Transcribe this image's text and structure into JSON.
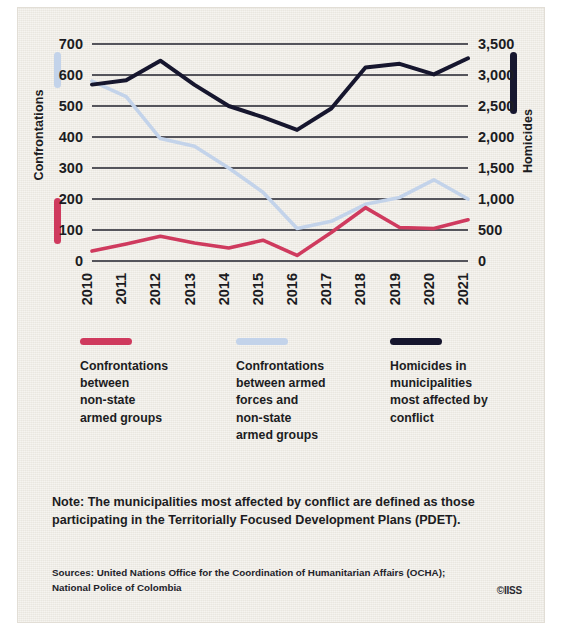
{
  "axes": {
    "left_title": "Confrontations",
    "right_title": "Homicides",
    "left_ticks": [
      "700",
      "600",
      "500",
      "400",
      "300",
      "200",
      "100",
      "0"
    ],
    "right_ticks": [
      "3,500",
      "3,000",
      "2,500",
      "2,000",
      "1,500",
      "1,000",
      "500",
      "0"
    ],
    "x_ticks": [
      "2010",
      "2011",
      "2012",
      "2013",
      "2014",
      "2015",
      "2016",
      "2017",
      "2018",
      "2019",
      "2020",
      "2021"
    ]
  },
  "legend": [
    {
      "key": "confrontations-non-state",
      "color": "#cf3a5e",
      "lines": [
        "Confrontations",
        "between",
        "non-state",
        "armed groups"
      ]
    },
    {
      "key": "confrontations-armed-forces",
      "color": "#c3d3ea",
      "lines": [
        "Confrontations",
        "between armed",
        "forces and",
        "non-state",
        "armed groups"
      ]
    },
    {
      "key": "homicides",
      "color": "#16162e",
      "lines": [
        "Homicides in",
        "municipalities",
        "most affected by",
        "conflict"
      ]
    }
  ],
  "note": "Note: The municipalities most affected by conflict are defined as those participating in the Territorially Focused Development Plans (PDET).",
  "sources": "Sources: United Nations Office for the Coordination of Humanitarian Affairs (OCHA); National Police of Colombia",
  "copyright": "©IISS",
  "colors": {
    "background": "#eeebe4",
    "gridline": "#55555c",
    "text": "#1c1c22",
    "crimson": "#cf3a5e",
    "lightblue": "#c3d3ea",
    "navy": "#16162e"
  },
  "chart_data": {
    "type": "line",
    "title": "",
    "xlabel": "",
    "ylabel": "Confrontations",
    "y2label": "Homicides",
    "x": [
      "2010",
      "2011",
      "2012",
      "2013",
      "2014",
      "2015",
      "2016",
      "2017",
      "2018",
      "2019",
      "2020",
      "2021"
    ],
    "ylim": [
      0,
      700
    ],
    "y2lim": [
      0,
      3500
    ],
    "grid": true,
    "legend_position": "below",
    "series": [
      {
        "name": "Confrontations between non-state armed groups",
        "axis": "left",
        "color": "#cf3a5e",
        "values": [
          32,
          55,
          80,
          58,
          42,
          67,
          18,
          92,
          172,
          108,
          105,
          133
        ]
      },
      {
        "name": "Confrontations between armed forces and non-state armed groups",
        "axis": "left",
        "color": "#c3d3ea",
        "values": [
          580,
          530,
          395,
          370,
          300,
          222,
          105,
          128,
          183,
          205,
          262,
          200
        ]
      },
      {
        "name": "Homicides in municipalities most affected by conflict",
        "axis": "right",
        "color": "#16162e",
        "values": [
          2845,
          2915,
          3230,
          2840,
          2500,
          2320,
          2115,
          2460,
          3120,
          3180,
          3010,
          3270
        ]
      }
    ]
  }
}
